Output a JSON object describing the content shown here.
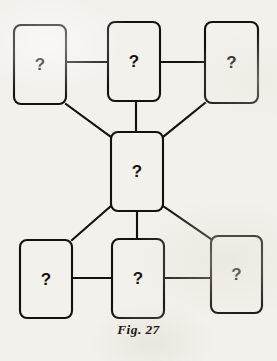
{
  "figure": {
    "caption": "Fig. 27",
    "background_color": "#f3f1ec",
    "ink_color": "#14120f",
    "node_label": "?",
    "node_shape": "rounded-rectangle"
  },
  "nodes": [
    {
      "id": "top-left",
      "label": "?",
      "x": 14,
      "y": 25,
      "width": 52,
      "height": 79,
      "row": "top",
      "column": "left"
    },
    {
      "id": "top-center",
      "label": "?",
      "x": 108,
      "y": 22,
      "width": 52,
      "height": 79,
      "row": "top",
      "column": "center"
    },
    {
      "id": "top-right",
      "label": "?",
      "x": 205,
      "y": 22,
      "width": 53,
      "height": 81,
      "row": "top",
      "column": "right"
    },
    {
      "id": "center-hub",
      "label": "?",
      "x": 111,
      "y": 132,
      "width": 52,
      "height": 79,
      "row": "middle",
      "column": "center"
    },
    {
      "id": "bottom-left",
      "label": "?",
      "x": 20,
      "y": 240,
      "width": 52,
      "height": 78,
      "row": "bottom",
      "column": "left"
    },
    {
      "id": "bottom-center",
      "label": "?",
      "x": 112,
      "y": 239,
      "width": 52,
      "height": 79,
      "row": "bottom",
      "column": "center"
    },
    {
      "id": "bottom-right",
      "label": "?",
      "x": 211,
      "y": 236,
      "width": 51,
      "height": 77,
      "row": "bottom",
      "column": "right"
    }
  ],
  "connectors": [
    {
      "id": "top-left-to-top-center",
      "from": "top-left",
      "to": "top-center",
      "kind": "horizontal",
      "x1": 66,
      "y1": 62,
      "x2": 108,
      "y2": 62
    },
    {
      "id": "top-center-to-top-right",
      "from": "top-center",
      "to": "top-right",
      "kind": "horizontal",
      "x1": 160,
      "y1": 62,
      "x2": 205,
      "y2": 62
    },
    {
      "id": "top-center-to-center-hub",
      "from": "top-center",
      "to": "center-hub",
      "kind": "vertical",
      "x1": 136,
      "y1": 101,
      "x2": 136,
      "y2": 132
    },
    {
      "id": "top-left-to-center-hub",
      "from": "top-left",
      "to": "center-hub",
      "kind": "diagonal",
      "x1": 66,
      "y1": 104,
      "x2": 111,
      "y2": 137
    },
    {
      "id": "top-right-to-center-hub",
      "from": "top-right",
      "to": "center-hub",
      "kind": "diagonal",
      "x1": 205,
      "y1": 103,
      "x2": 163,
      "y2": 137
    },
    {
      "id": "center-hub-to-bottom-left",
      "from": "center-hub",
      "to": "bottom-left",
      "kind": "diagonal",
      "x1": 111,
      "y1": 206,
      "x2": 72,
      "y2": 240
    },
    {
      "id": "center-hub-to-bottom-right",
      "from": "center-hub",
      "to": "bottom-right",
      "kind": "diagonal",
      "x1": 163,
      "y1": 206,
      "x2": 211,
      "y2": 239
    },
    {
      "id": "center-hub-to-bottom-center",
      "from": "center-hub",
      "to": "bottom-center",
      "kind": "vertical",
      "x1": 137,
      "y1": 211,
      "x2": 137,
      "y2": 239
    },
    {
      "id": "bottom-left-to-bottom-center",
      "from": "bottom-left",
      "to": "bottom-center",
      "kind": "horizontal",
      "x1": 72,
      "y1": 278,
      "x2": 112,
      "y2": 278
    },
    {
      "id": "bottom-center-to-bottom-right",
      "from": "bottom-center",
      "to": "bottom-right",
      "kind": "horizontal",
      "x1": 164,
      "y1": 278,
      "x2": 211,
      "y2": 278
    }
  ]
}
